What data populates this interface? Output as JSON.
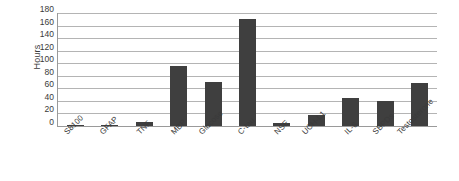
{
  "chart_data": {
    "type": "bar",
    "title": "",
    "xlabel": "",
    "ylabel": "Hours",
    "ylim": [
      0,
      180
    ],
    "ytick_step": 20,
    "yticks": [
      180,
      160,
      140,
      120,
      100,
      80,
      60,
      40,
      20,
      0
    ],
    "grid": true,
    "legend": null,
    "bar_color": "#3f3f3f",
    "categories": [
      "S8100",
      "GFAP",
      "TNF",
      "MBP",
      "Glucose",
      "C-tau",
      "NSE",
      "UCH-L1",
      "IL-6",
      "SBPDs",
      "Testosterone"
    ],
    "values": [
      2,
      2,
      6,
      95,
      70,
      170,
      5,
      17,
      44,
      40,
      68
    ],
    "series": [
      {
        "name": "Hours",
        "values": [
          2,
          2,
          6,
          95,
          70,
          170,
          5,
          17,
          44,
          40,
          68
        ]
      }
    ]
  },
  "axis": {
    "y_title": "Hours"
  }
}
